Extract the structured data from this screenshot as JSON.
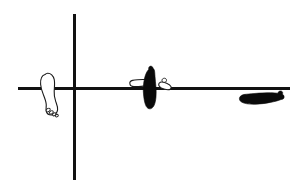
{
  "figure": {
    "description": "Line-art diagram of four feet arranged around a pair of crossed reference axes",
    "background_color": "#ffffff",
    "ink_color": "#111111",
    "width": 300,
    "height": 190
  },
  "axes": {
    "horizontal": {
      "name": "horizontal-axis",
      "x1": 18,
      "y1": 88.5,
      "x2": 290,
      "y2": 88.5,
      "stroke_width": 3,
      "color": "#111111"
    },
    "vertical": {
      "name": "vertical-axis",
      "x1": 74.5,
      "y1": 14,
      "x2": 74.5,
      "y2": 180,
      "stroke_width": 3,
      "color": "#111111"
    },
    "origin": {
      "x": 74.5,
      "y": 88.5
    }
  },
  "feet": [
    {
      "id": "foot-left-outline",
      "label": "Left outlined foot",
      "style": "outline",
      "fill": "#ffffff",
      "stroke": "#1a1a1a",
      "orientation": "vertical",
      "heel": "top",
      "toes": "bottom-right",
      "center": {
        "x": 49,
        "y": 97
      },
      "toe_count": 4
    },
    {
      "id": "foot-center-solid",
      "label": "Center filled foot",
      "style": "solid",
      "fill": "#0a0a0a",
      "stroke": "#0a0a0a",
      "orientation": "vertical",
      "heel": "bottom",
      "toes": "top",
      "center": {
        "x": 150,
        "y": 86
      },
      "toe_count": 1
    },
    {
      "id": "foot-center-outline",
      "label": "Center outlined foot pointing left",
      "style": "outline",
      "fill": "#ffffff",
      "stroke": "#1a1a1a",
      "orientation": "horizontal",
      "heel": "right",
      "toes": "left",
      "center": {
        "x": 140,
        "y": 84
      },
      "toe_count": 0
    },
    {
      "id": "foot-center-small-outline",
      "label": "Small outlined foot at right of center cluster",
      "style": "outline",
      "fill": "#ffffff",
      "stroke": "#1a1a1a",
      "orientation": "diagonal",
      "heel": "top-left",
      "toes": "bottom-right",
      "center": {
        "x": 166,
        "y": 88
      },
      "toe_count": 0
    },
    {
      "id": "foot-right-solid",
      "label": "Right filled foot pointing right",
      "style": "solid",
      "fill": "#0a0a0a",
      "stroke": "#0a0a0a",
      "orientation": "horizontal",
      "heel": "left",
      "toes": "right",
      "center": {
        "x": 262,
        "y": 98
      },
      "toe_count": 1
    }
  ]
}
